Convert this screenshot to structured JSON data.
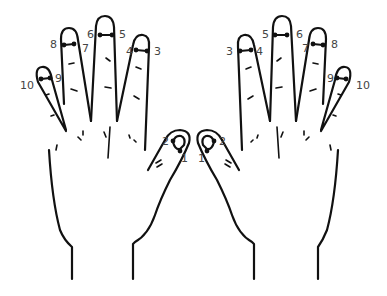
{
  "diagram": {
    "type": "hand-finger-points",
    "colors": {
      "ink": "#111111",
      "label": "#444444",
      "background": "#ffffff"
    },
    "left_hand": {
      "labels": [
        {
          "id": "1",
          "text": "1",
          "finger": "thumb"
        },
        {
          "id": "2",
          "text": "2",
          "finger": "thumb"
        },
        {
          "id": "3",
          "text": "3",
          "finger": "index"
        },
        {
          "id": "4",
          "text": "4",
          "finger": "index"
        },
        {
          "id": "5",
          "text": "5",
          "finger": "middle"
        },
        {
          "id": "6",
          "text": "6",
          "finger": "middle"
        },
        {
          "id": "7",
          "text": "7",
          "finger": "ring"
        },
        {
          "id": "8",
          "text": "8",
          "finger": "ring"
        },
        {
          "id": "9",
          "text": "9",
          "finger": "little"
        },
        {
          "id": "10",
          "text": "10",
          "finger": "little"
        }
      ]
    },
    "right_hand": {
      "labels": [
        {
          "id": "1",
          "text": "1",
          "finger": "thumb"
        },
        {
          "id": "2",
          "text": "2",
          "finger": "thumb"
        },
        {
          "id": "3",
          "text": "3",
          "finger": "index"
        },
        {
          "id": "4",
          "text": "4",
          "finger": "index"
        },
        {
          "id": "5",
          "text": "5",
          "finger": "middle"
        },
        {
          "id": "6",
          "text": "6",
          "finger": "middle"
        },
        {
          "id": "7",
          "text": "7",
          "finger": "ring"
        },
        {
          "id": "8",
          "text": "8",
          "finger": "ring"
        },
        {
          "id": "9",
          "text": "9",
          "finger": "little"
        },
        {
          "id": "10",
          "text": "10",
          "finger": "little"
        }
      ]
    }
  }
}
